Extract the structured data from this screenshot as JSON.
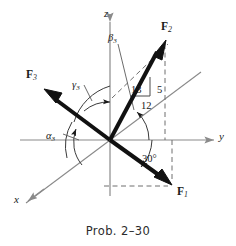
{
  "figure": {
    "caption": "Prob. 2–30",
    "background_color": "#ffffff",
    "ink_color": "#1a1a1a",
    "thin_line_color": "#8a8a8a"
  },
  "axes": [
    {
      "name": "z",
      "label": "z",
      "direction": "up",
      "label_x": 104,
      "label_y": 8
    },
    {
      "name": "y",
      "label": "y",
      "direction": "right",
      "label_x": 219,
      "label_y": 131
    },
    {
      "name": "x",
      "label": "x",
      "direction": "lower-left",
      "label_x": 14,
      "label_y": 194
    }
  ],
  "origin": {
    "x": 110,
    "y": 140
  },
  "vectors": [
    {
      "id": "F1",
      "label": "F",
      "subscript": "1",
      "label_x": 177,
      "label_y": 186,
      "tip": {
        "x": 172,
        "y": 186
      },
      "description": "force in lower-right, below the y-axis"
    },
    {
      "id": "F2",
      "label": "F",
      "subscript": "2",
      "label_x": 161,
      "label_y": 21,
      "tip": {
        "x": 165,
        "y": 41
      },
      "description": "force in upper-right, above the y-axis"
    },
    {
      "id": "F3",
      "label": "F",
      "subscript": "3",
      "label_x": 26,
      "label_y": 69,
      "tip": {
        "x": 45,
        "y": 89
      },
      "description": "force in upper-left"
    }
  ],
  "angles": [
    {
      "id": "alpha3",
      "label": "α",
      "subscript": "3",
      "label_x": 46,
      "label_y": 131,
      "description": "angle of F3 from positive x-direction, measured at origin"
    },
    {
      "id": "beta3",
      "label": "β",
      "subscript": "3",
      "label_x": 108,
      "label_y": 33,
      "description": "angle of F3 from positive y-axis"
    },
    {
      "id": "gamma3",
      "label": "γ",
      "subscript": "3",
      "label_x": 72,
      "label_y": 80,
      "description": "angle of F3 from positive z-axis"
    },
    {
      "id": "angle30",
      "label": "30°",
      "label_x": 142,
      "label_y": 154,
      "description": "angle of F1 below the y-axis"
    }
  ],
  "slope_triangle": {
    "description": "3-4-5 style right triangle on F2 giving its direction",
    "hypotenuse": {
      "value": "13",
      "x": 131,
      "y": 85
    },
    "vertical": {
      "value": "5",
      "x": 157,
      "y": 85
    },
    "horizontal": {
      "value": "12",
      "x": 141,
      "y": 101
    }
  }
}
